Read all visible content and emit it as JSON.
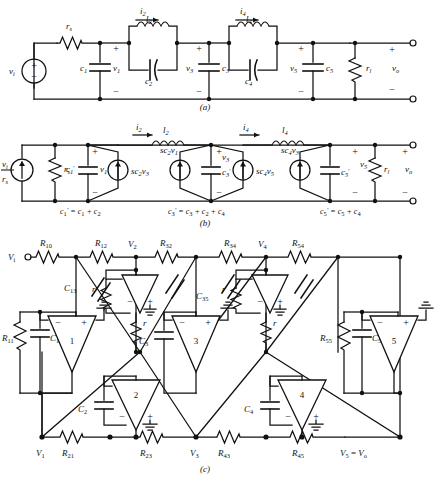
{
  "figure": {
    "subfigure_labels": [
      "(a)",
      "(b)",
      "(c)"
    ]
  },
  "panel_a": {
    "label": "(a)",
    "description": "Passive LC ladder low-pass filter with source and load resistors",
    "source_label": "v",
    "source_sub": "i",
    "elements": {
      "rs": "r",
      "rs_sub": "s",
      "c1": "c",
      "c1_sub": "1",
      "v1": "v",
      "v1_sub": "1",
      "l2": "l",
      "l2_sub": "2",
      "c2": "c",
      "c2_sub": "2",
      "i2": "i",
      "i2_sub": "2",
      "v3": "v",
      "v3_sub": "3",
      "c3": "c",
      "c3_sub": "3",
      "l4": "l",
      "l4_sub": "4",
      "c4": "c",
      "c4_sub": "4",
      "i4": "i",
      "i4_sub": "4",
      "v5": "v",
      "v5_sub": "5",
      "c5": "c",
      "c5_sub": "5",
      "rl": "r",
      "rl_sub": "l",
      "vo": "v",
      "vo_sub": "o"
    },
    "polarity_plus": "+",
    "polarity_minus": "−"
  },
  "panel_b": {
    "label": "(b)",
    "description": "Norton-equivalent active model with voltage-controlled current sources",
    "source_num": "v",
    "source_num_sub": "i",
    "source_den": "r",
    "source_den_sub": "s",
    "elements": {
      "rs": "r",
      "rs_sub": "s",
      "c1p": "c",
      "c1p_sub": "1",
      "c1p_prime": "′",
      "v1": "v",
      "v1_sub": "1",
      "i2": "i",
      "i2_sub": "2",
      "l2": "l",
      "l2_sub": "2",
      "i4": "i",
      "i4_sub": "4",
      "l4": "l",
      "l4_sub": "4",
      "v3": "v",
      "v3_sub": "3",
      "c3p": "c",
      "c3p_sub": "3",
      "c3p_prime": "′",
      "c5p": "c",
      "c5p_sub": "5",
      "c5p_prime": "′",
      "v5": "v",
      "v5_sub": "5",
      "rl": "r",
      "rl_sub": "l",
      "vo": "v",
      "vo_sub": "o"
    },
    "sources": [
      {
        "name": "sc2v3",
        "prefix": "sc",
        "sub1": "2",
        "var": "v",
        "sub2": "3"
      },
      {
        "name": "sc2v1",
        "prefix": "sc",
        "sub1": "2",
        "var": "v",
        "sub2": "1"
      },
      {
        "name": "sc4v5",
        "prefix": "sc",
        "sub1": "4",
        "var": "v",
        "sub2": "5"
      },
      {
        "name": "sc4v3",
        "prefix": "sc",
        "sub1": "4",
        "var": "v",
        "sub2": "3"
      }
    ],
    "equations": [
      "c′₁ = c₁ + c₂",
      "c′₃ = c₃ + c₂ + c₄",
      "c′₅ = c₅ + c₄"
    ],
    "equation_parts": [
      {
        "lhs": "c",
        "lhs_sub": "1",
        "prime": "′",
        "rhs": "= c₁ + c₂"
      },
      {
        "lhs": "c",
        "lhs_sub": "3",
        "prime": "′",
        "rhs": "= c₃ + c₂ + c₄"
      },
      {
        "lhs": "c",
        "lhs_sub": "5",
        "prime": "′",
        "rhs": "= c₅ + c₄"
      }
    ]
  },
  "panel_c": {
    "label": "(c)",
    "description": "Active RC leapfrog realization using five op-amp integrators",
    "input_label": "V",
    "input_sub": "i",
    "output_label": "V₅ = V",
    "output_sub": "o",
    "node_labels": [
      {
        "name": "V",
        "sub": "1"
      },
      {
        "name": "V",
        "sub": "2"
      },
      {
        "name": "V",
        "sub": "3"
      },
      {
        "name": "V",
        "sub": "4"
      },
      {
        "name": "V",
        "sub": "5"
      }
    ],
    "resistors": [
      {
        "name": "R",
        "sub": "10"
      },
      {
        "name": "R",
        "sub": "12"
      },
      {
        "name": "R",
        "sub": "32"
      },
      {
        "name": "R",
        "sub": "34"
      },
      {
        "name": "R",
        "sub": "54"
      },
      {
        "name": "R",
        "sub": "11"
      },
      {
        "name": "R",
        "sub": "55"
      },
      {
        "name": "R",
        "sub": "21"
      },
      {
        "name": "R",
        "sub": "23"
      },
      {
        "name": "R",
        "sub": "43"
      },
      {
        "name": "R",
        "sub": "45"
      }
    ],
    "capacitors": [
      {
        "name": "C",
        "sub": "13"
      },
      {
        "name": "C",
        "sub": "31"
      },
      {
        "name": "C",
        "sub": "35"
      },
      {
        "name": "C",
        "sub": "53"
      },
      {
        "name": "C",
        "sub": "1"
      },
      {
        "name": "C",
        "sub": "2"
      },
      {
        "name": "C",
        "sub": "3"
      },
      {
        "name": "C",
        "sub": "4"
      },
      {
        "name": "C",
        "sub": "5"
      }
    ],
    "unit_resistors": [
      {
        "name": "r"
      },
      {
        "name": "r"
      },
      {
        "name": "r"
      },
      {
        "name": "r"
      }
    ],
    "opamps": [
      {
        "number": "1",
        "minus": "−",
        "plus": "+"
      },
      {
        "number": "2",
        "minus": "−",
        "plus": "+"
      },
      {
        "number": "3",
        "minus": "−",
        "plus": "+"
      },
      {
        "number": "4",
        "minus": "−",
        "plus": "+"
      },
      {
        "number": "5",
        "minus": "−",
        "plus": "+"
      }
    ]
  },
  "colors": {
    "ink": "#111111",
    "paper": "#ffffff"
  }
}
